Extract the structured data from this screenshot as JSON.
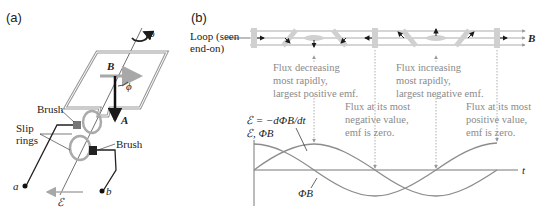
{
  "panels": {
    "a": {
      "label": "(a)"
    },
    "b": {
      "label": "(b)"
    }
  },
  "generator": {
    "omega_label": "ω",
    "B_label": "B",
    "phi_label": "ϕ",
    "A_label": "A",
    "brush_top_label": "Brush",
    "brush_bottom_label": "Brush",
    "slip_rings_line1": "Slip",
    "slip_rings_line2": "rings",
    "terminal_a": "a",
    "terminal_b": "b",
    "emf_label": "ℰ"
  },
  "loop_strip": {
    "label_line1": "Loop (seen",
    "label_line2": "end-on)",
    "B_label": "B"
  },
  "annotations": [
    {
      "id": "decreasing",
      "lines": [
        "Flux decreasing",
        "most rapidly,",
        "largest positive emf."
      ]
    },
    {
      "id": "increasing",
      "lines": [
        "Flux increasing",
        "most rapidly,",
        "largest negative emf."
      ]
    },
    {
      "id": "most-negative",
      "lines": [
        "Flux at its most",
        "negative value,",
        "emf is zero."
      ]
    },
    {
      "id": "most-positive",
      "lines": [
        "Flux at its most",
        "positive value,",
        "emf is zero."
      ]
    }
  ],
  "graph": {
    "equation": "ℰ = −dΦB/dt",
    "y_axis_label": "ℰ, ΦB",
    "x_axis_label": "t",
    "phi_curve_label": "ΦB"
  },
  "colors": {
    "curve": "#8c8c8c",
    "loop": "#a0a0a0",
    "annotation_text": "#8a8a8a",
    "ink": "#1a1a1a"
  }
}
